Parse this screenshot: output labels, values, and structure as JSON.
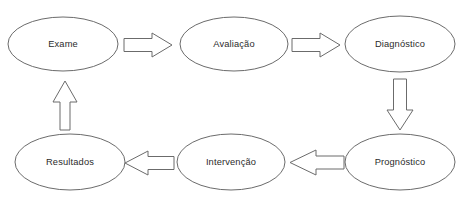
{
  "diagram": {
    "type": "cyclical-process-flow",
    "background_color": "#ffffff",
    "stroke_color": "#6b6b6b",
    "text_color": "#2b2b2b",
    "nodes": [
      {
        "id": "exame",
        "label": "Exame",
        "cx": 63,
        "cy": 44,
        "rx": 55,
        "ry": 27,
        "row": "top",
        "col": 1
      },
      {
        "id": "avaliacao",
        "label": "Avaliação",
        "cx": 234,
        "cy": 44,
        "rx": 54,
        "ry": 27,
        "row": "top",
        "col": 2
      },
      {
        "id": "diagnostico",
        "label": "Diagnóstico",
        "cx": 400,
        "cy": 44,
        "rx": 55,
        "ry": 28,
        "row": "top",
        "col": 3
      },
      {
        "id": "prognostico",
        "label": "Prognóstico",
        "cx": 400,
        "cy": 162,
        "rx": 55,
        "ry": 28,
        "row": "bottom",
        "col": 3
      },
      {
        "id": "intervencao",
        "label": "Intervenção",
        "cx": 231,
        "cy": 162,
        "rx": 54,
        "ry": 28,
        "row": "bottom",
        "col": 2
      },
      {
        "id": "resultados",
        "label": "Resultados",
        "cx": 70,
        "cy": 162,
        "rx": 55,
        "ry": 28,
        "row": "bottom",
        "col": 1
      }
    ],
    "arrows": [
      {
        "id": "exame-to-avaliacao",
        "from": "exame",
        "to": "avaliacao",
        "direction": "right"
      },
      {
        "id": "avaliacao-to-diagnostico",
        "from": "avaliacao",
        "to": "diagnostico",
        "direction": "right"
      },
      {
        "id": "diagnostico-to-prognostico",
        "from": "diagnostico",
        "to": "prognostico",
        "direction": "down"
      },
      {
        "id": "prognostico-to-intervencao",
        "from": "prognostico",
        "to": "intervencao",
        "direction": "left"
      },
      {
        "id": "intervencao-to-resultados",
        "from": "intervencao",
        "to": "resultados",
        "direction": "left"
      },
      {
        "id": "resultados-to-exame",
        "from": "resultados",
        "to": "exame",
        "direction": "up"
      }
    ]
  }
}
